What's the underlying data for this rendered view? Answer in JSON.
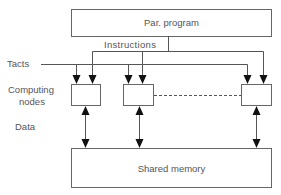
{
  "diagram": {
    "program_box": {
      "label": "Par. program"
    },
    "instructions_label": "Instructions",
    "tacts_label": "Tacts",
    "nodes_label_line1": "Computing",
    "nodes_label_line2": "nodes",
    "data_label": "Data",
    "memory_box": {
      "label": "Shared memory"
    },
    "node_count_visible": 3,
    "colors": {
      "stroke": "#555555",
      "text": "#555555",
      "background": "#ffffff"
    }
  }
}
